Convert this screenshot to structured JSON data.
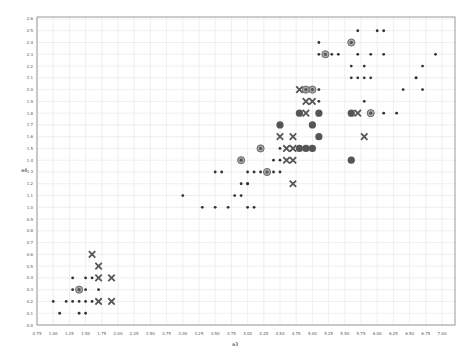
{
  "chart_data": {
    "type": "scatter",
    "title": "",
    "xlabel": "a3",
    "ylabel": "a4",
    "xlim": [
      0.75,
      7.0
    ],
    "ylim": [
      0.0,
      2.6
    ],
    "grid": true,
    "x_ticks": [
      "0.75",
      "1.00",
      "1.25",
      "1.50",
      "1.75",
      "2.00",
      "2.25",
      "2.50",
      "2.75",
      "3.00",
      "3.25",
      "3.50",
      "3.75",
      "4.00",
      "4.25",
      "4.50",
      "4.75",
      "5.00",
      "5.25",
      "5.50",
      "5.75",
      "6.00",
      "6.25",
      "6.50",
      "6.75",
      "7.00"
    ],
    "y_ticks": [
      "0.0",
      "0.1",
      "0.2",
      "0.3",
      "0.4",
      "0.5",
      "0.6",
      "0.7",
      "0.8",
      "0.9",
      "1.0",
      "1.1",
      "1.2",
      "1.3",
      "1.4",
      "1.5",
      "1.6",
      "1.7",
      "1.8",
      "1.9",
      "2.0",
      "2.1",
      "2.2",
      "2.3",
      "2.4",
      "2.5",
      "2.6"
    ],
    "marker_legend": {
      "dot": "small dot",
      "ring": "ring (cluster)",
      "x": "x (error)",
      "disc": "filled disc"
    },
    "points": [
      {
        "x": 1.0,
        "y": 0.2,
        "m": "dot"
      },
      {
        "x": 1.1,
        "y": 0.1,
        "m": "dot"
      },
      {
        "x": 1.2,
        "y": 0.2,
        "m": "dot"
      },
      {
        "x": 1.3,
        "y": 0.2,
        "m": "dot"
      },
      {
        "x": 1.4,
        "y": 0.2,
        "m": "dot"
      },
      {
        "x": 1.5,
        "y": 0.2,
        "m": "dot"
      },
      {
        "x": 1.6,
        "y": 0.2,
        "m": "dot"
      },
      {
        "x": 1.4,
        "y": 0.1,
        "m": "dot"
      },
      {
        "x": 1.5,
        "y": 0.1,
        "m": "dot"
      },
      {
        "x": 1.3,
        "y": 0.3,
        "m": "dot"
      },
      {
        "x": 1.4,
        "y": 0.3,
        "m": "ring"
      },
      {
        "x": 1.5,
        "y": 0.3,
        "m": "dot"
      },
      {
        "x": 1.7,
        "y": 0.3,
        "m": "dot"
      },
      {
        "x": 1.3,
        "y": 0.4,
        "m": "dot"
      },
      {
        "x": 1.5,
        "y": 0.4,
        "m": "dot"
      },
      {
        "x": 1.6,
        "y": 0.4,
        "m": "dot"
      },
      {
        "x": 1.6,
        "y": 0.6,
        "m": "x"
      },
      {
        "x": 1.7,
        "y": 0.5,
        "m": "x"
      },
      {
        "x": 1.7,
        "y": 0.4,
        "m": "x"
      },
      {
        "x": 1.9,
        "y": 0.4,
        "m": "x"
      },
      {
        "x": 1.7,
        "y": 0.2,
        "m": "x"
      },
      {
        "x": 1.9,
        "y": 0.2,
        "m": "x"
      },
      {
        "x": 3.0,
        "y": 1.1,
        "m": "dot"
      },
      {
        "x": 3.3,
        "y": 1.0,
        "m": "dot"
      },
      {
        "x": 3.5,
        "y": 1.0,
        "m": "dot"
      },
      {
        "x": 3.7,
        "y": 1.0,
        "m": "dot"
      },
      {
        "x": 3.9,
        "y": 1.1,
        "m": "dot"
      },
      {
        "x": 3.5,
        "y": 1.3,
        "m": "dot"
      },
      {
        "x": 3.6,
        "y": 1.3,
        "m": "dot"
      },
      {
        "x": 3.8,
        "y": 1.1,
        "m": "dot"
      },
      {
        "x": 3.9,
        "y": 1.2,
        "m": "dot"
      },
      {
        "x": 4.0,
        "y": 1.2,
        "m": "dot"
      },
      {
        "x": 4.0,
        "y": 1.3,
        "m": "dot"
      },
      {
        "x": 4.1,
        "y": 1.3,
        "m": "dot"
      },
      {
        "x": 4.2,
        "y": 1.3,
        "m": "dot"
      },
      {
        "x": 4.3,
        "y": 1.3,
        "m": "ring"
      },
      {
        "x": 4.4,
        "y": 1.3,
        "m": "dot"
      },
      {
        "x": 4.5,
        "y": 1.3,
        "m": "dot"
      },
      {
        "x": 4.0,
        "y": 1.0,
        "m": "dot"
      },
      {
        "x": 4.1,
        "y": 1.0,
        "m": "dot"
      },
      {
        "x": 3.9,
        "y": 1.4,
        "m": "ring"
      },
      {
        "x": 4.2,
        "y": 1.5,
        "m": "ring"
      },
      {
        "x": 4.0,
        "y": 1.2,
        "m": "dot"
      },
      {
        "x": 4.5,
        "y": 1.4,
        "m": "dot"
      },
      {
        "x": 4.4,
        "y": 1.4,
        "m": "dot"
      },
      {
        "x": 4.6,
        "y": 1.4,
        "m": "x"
      },
      {
        "x": 4.7,
        "y": 1.4,
        "m": "x"
      },
      {
        "x": 4.5,
        "y": 1.5,
        "m": "dot"
      },
      {
        "x": 4.6,
        "y": 1.5,
        "m": "x"
      },
      {
        "x": 4.7,
        "y": 1.5,
        "m": "x"
      },
      {
        "x": 4.8,
        "y": 1.5,
        "m": "disc"
      },
      {
        "x": 4.9,
        "y": 1.5,
        "m": "disc"
      },
      {
        "x": 5.0,
        "y": 1.5,
        "m": "disc"
      },
      {
        "x": 4.5,
        "y": 1.6,
        "m": "x"
      },
      {
        "x": 4.7,
        "y": 1.6,
        "m": "x"
      },
      {
        "x": 5.1,
        "y": 1.6,
        "m": "disc"
      },
      {
        "x": 4.5,
        "y": 1.7,
        "m": "disc"
      },
      {
        "x": 5.0,
        "y": 1.7,
        "m": "disc"
      },
      {
        "x": 4.8,
        "y": 1.8,
        "m": "disc"
      },
      {
        "x": 4.9,
        "y": 1.8,
        "m": "x"
      },
      {
        "x": 5.1,
        "y": 1.8,
        "m": "disc"
      },
      {
        "x": 5.6,
        "y": 1.8,
        "m": "disc"
      },
      {
        "x": 5.7,
        "y": 1.8,
        "m": "x"
      },
      {
        "x": 5.9,
        "y": 1.8,
        "m": "ring"
      },
      {
        "x": 6.1,
        "y": 1.8,
        "m": "dot"
      },
      {
        "x": 6.3,
        "y": 1.8,
        "m": "dot"
      },
      {
        "x": 4.9,
        "y": 1.9,
        "m": "x"
      },
      {
        "x": 5.0,
        "y": 1.9,
        "m": "x"
      },
      {
        "x": 5.1,
        "y": 1.9,
        "m": "dot"
      },
      {
        "x": 5.8,
        "y": 1.9,
        "m": "dot"
      },
      {
        "x": 4.8,
        "y": 2.0,
        "m": "x"
      },
      {
        "x": 4.9,
        "y": 2.0,
        "m": "ring"
      },
      {
        "x": 5.0,
        "y": 2.0,
        "m": "ring"
      },
      {
        "x": 5.1,
        "y": 2.0,
        "m": "dot"
      },
      {
        "x": 5.6,
        "y": 2.1,
        "m": "dot"
      },
      {
        "x": 5.7,
        "y": 2.1,
        "m": "dot"
      },
      {
        "x": 5.8,
        "y": 2.1,
        "m": "dot"
      },
      {
        "x": 5.9,
        "y": 2.1,
        "m": "dot"
      },
      {
        "x": 6.6,
        "y": 2.1,
        "m": "dot"
      },
      {
        "x": 5.6,
        "y": 2.2,
        "m": "dot"
      },
      {
        "x": 5.8,
        "y": 2.2,
        "m": "dot"
      },
      {
        "x": 6.7,
        "y": 2.2,
        "m": "dot"
      },
      {
        "x": 5.1,
        "y": 2.3,
        "m": "dot"
      },
      {
        "x": 5.2,
        "y": 2.3,
        "m": "ring"
      },
      {
        "x": 5.3,
        "y": 2.3,
        "m": "dot"
      },
      {
        "x": 5.4,
        "y": 2.3,
        "m": "dot"
      },
      {
        "x": 5.7,
        "y": 2.3,
        "m": "dot"
      },
      {
        "x": 5.9,
        "y": 2.3,
        "m": "dot"
      },
      {
        "x": 6.1,
        "y": 2.3,
        "m": "dot"
      },
      {
        "x": 6.9,
        "y": 2.3,
        "m": "dot"
      },
      {
        "x": 5.1,
        "y": 2.4,
        "m": "dot"
      },
      {
        "x": 5.6,
        "y": 2.4,
        "m": "ring"
      },
      {
        "x": 6.1,
        "y": 2.5,
        "m": "dot"
      },
      {
        "x": 6.0,
        "y": 2.5,
        "m": "dot"
      },
      {
        "x": 5.7,
        "y": 2.5,
        "m": "dot"
      },
      {
        "x": 6.7,
        "y": 2.0,
        "m": "dot"
      },
      {
        "x": 6.4,
        "y": 2.0,
        "m": "dot"
      },
      {
        "x": 6.6,
        "y": 2.1,
        "m": "dot"
      },
      {
        "x": 5.6,
        "y": 1.4,
        "m": "disc"
      },
      {
        "x": 5.8,
        "y": 1.6,
        "m": "x"
      },
      {
        "x": 4.7,
        "y": 1.2,
        "m": "x"
      }
    ]
  }
}
